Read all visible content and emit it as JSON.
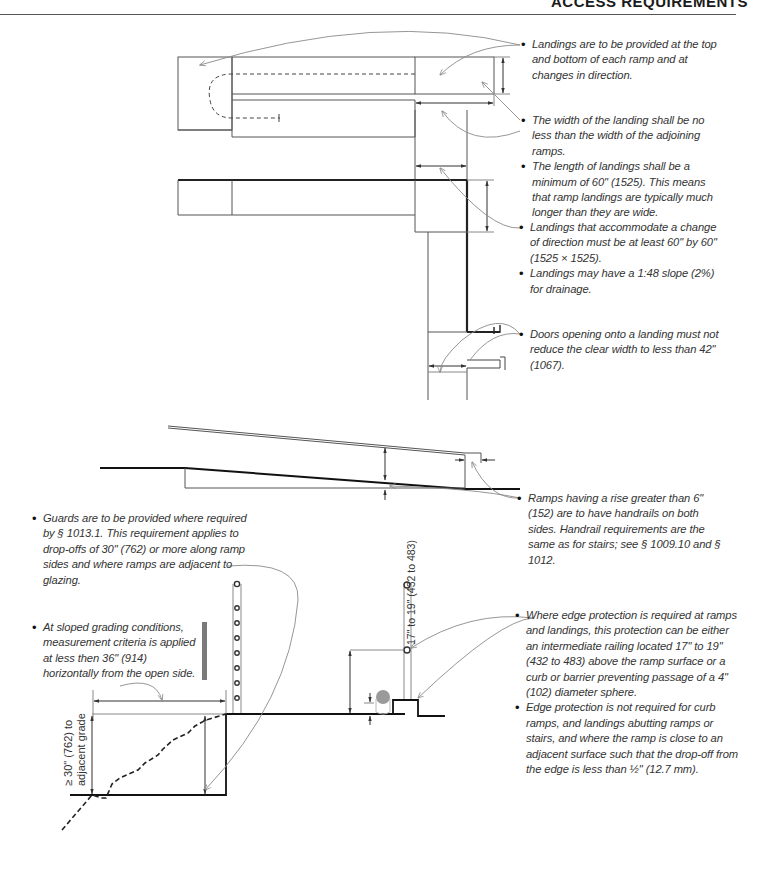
{
  "header": {
    "title": "ACCESS REQUIREMENTS"
  },
  "notes": {
    "landings_top_bottom": "Landings are to be provided at the top and bottom of each ramp and at changes in direction.",
    "landing_width": "The width of the landing shall be no less than the width of the adjoining ramps.",
    "landing_length": "The length of landings shall be a minimum of 60\" (1525). This means that ramp landings are typically much longer than they are wide.",
    "change_direction": "Landings that accommodate a change of direction must be at least 60\" by 60\" (1525 × 1525).",
    "landing_slope": "Landings may have a 1:48 slope (2%) for drainage.",
    "doors": "Doors opening onto a landing must not reduce the clear width to less than 42\" (1067).",
    "handrails": "Ramps having a rise greater than 6\" (152) are to have handrails on both sides. Handrail requirements are the same as for stairs; see § 1009.10 and § 1012.",
    "guards": "Guards are to be provided where required by § 1013.1. This requirement applies to drop-offs of 30\" (762) or more along ramp sides and where ramps are adjacent to glazing.",
    "sloped_grading": "At sloped grading conditions, measurement criteria is applied at less then 36\" (914) horizontally from the open side.",
    "edge_protection": "Where edge protection is required at ramps and landings, this protection can be either an intermediate railing located 17\" to 19\" (432 to 483) above the ramp surface or a curb or barrier preventing passage of a 4\" (102) diameter sphere.",
    "edge_not_required": "Edge protection is not required for curb ramps, and landings abutting ramps or stairs, and where the ramp is close to an adjacent surface such that the drop-off from the edge is less than ½\" (12.7 mm)."
  },
  "dimension_labels": {
    "drop_off": "≥ 30\" (762) to",
    "drop_off_2": "adjacent grade",
    "railing_height": "17\" to 19\" (432 to 483)"
  },
  "colors": {
    "line": "#333333",
    "thin_line": "#777777",
    "leader": "#8a8a8a",
    "gray_bar": "#7a7a7a",
    "sphere": "#9a9a9a"
  }
}
